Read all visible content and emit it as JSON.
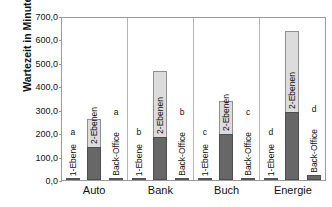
{
  "chart_data": {
    "type": "bar",
    "title": "",
    "xlabel": "",
    "ylabel": "Wartezeit in Minuten",
    "ylim": [
      0,
      700
    ],
    "ytick_step": 100,
    "ytick_labels": [
      "700,0",
      "600,0",
      "500,0",
      "400,0",
      "300,0",
      "200,0",
      "100,0",
      "0,0"
    ],
    "ytick_values": [
      700,
      600,
      500,
      400,
      300,
      200,
      100,
      0
    ],
    "grid": false,
    "legend": "none",
    "stacked": true,
    "decimal_separator": ",",
    "categories": [
      "Auto",
      "Bank",
      "Buch",
      "Energie"
    ],
    "bar_labels": [
      "1-Ebene",
      "2-Ebenen",
      "Back-Office"
    ],
    "series": [
      {
        "name": "unterer Abschnitt",
        "color": "#676767",
        "values": [
          141,
          184,
          196,
          290
        ]
      },
      {
        "name": "oberer Abschnitt",
        "color": "#dcdcdc",
        "values": [
          119,
          281,
          141,
          346
        ]
      }
    ],
    "groups": [
      {
        "category": "Auto",
        "bars": [
          {
            "label": "1-Ebene",
            "value": 3,
            "letter": "a",
            "stacked": false
          },
          {
            "label": "2-Ebenen",
            "value": 260,
            "segments": [
              141,
              119
            ],
            "letter": "",
            "stacked": true
          },
          {
            "label": "Back-Office",
            "value": 3,
            "letter": "a",
            "stacked": false
          }
        ]
      },
      {
        "category": "Bank",
        "bars": [
          {
            "label": "1-Ebene",
            "value": 3,
            "letter": "b",
            "stacked": false
          },
          {
            "label": "2-Ebenen",
            "value": 465,
            "segments": [
              184,
              281
            ],
            "letter": "",
            "stacked": true
          },
          {
            "label": "Back-Office",
            "value": 3,
            "letter": "b",
            "stacked": false
          }
        ]
      },
      {
        "category": "Buch",
        "bars": [
          {
            "label": "1-Ebene",
            "value": 3,
            "letter": "c",
            "stacked": false
          },
          {
            "label": "2-Ebenen",
            "value": 337,
            "segments": [
              196,
              141
            ],
            "letter": "",
            "stacked": true
          },
          {
            "label": "Back-Office",
            "value": 2,
            "letter": "c",
            "stacked": false
          }
        ]
      },
      {
        "category": "Energie",
        "bars": [
          {
            "label": "1-Ebene",
            "value": 4,
            "letter": "d",
            "stacked": false
          },
          {
            "label": "2-Ebenen",
            "value": 636,
            "segments": [
              290,
              346
            ],
            "letter": "",
            "stacked": true
          },
          {
            "label": "Back-Office",
            "value": 21,
            "letter": "d",
            "stacked": false
          }
        ]
      }
    ]
  }
}
